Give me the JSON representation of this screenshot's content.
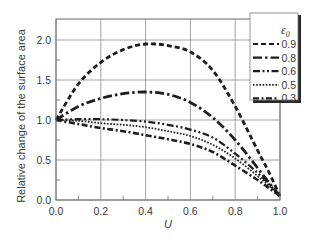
{
  "chart_data": {
    "type": "line",
    "title": "",
    "xlabel": "U",
    "ylabel": "Relative change of the surface area",
    "xlim": [
      0.0,
      1.0
    ],
    "ylim": [
      0.0,
      2.25
    ],
    "x_ticks": [
      "0.0",
      "0.2",
      "0.4",
      "0.6",
      "0.8",
      "1.0"
    ],
    "y_ticks": [
      "0.0",
      "0.5",
      "1.0",
      "1.5",
      "2.0"
    ],
    "grid": true,
    "legend": {
      "title": "ε0",
      "position": "upper right",
      "entries": [
        "0.9",
        "0.8",
        "0.6",
        "0.5",
        "0.3"
      ]
    },
    "x": [
      0.0,
      0.1,
      0.2,
      0.3,
      0.4,
      0.5,
      0.6,
      0.7,
      0.8,
      0.9,
      0.95,
      1.0
    ],
    "series": [
      {
        "name": "0.9",
        "style": "dashed",
        "values": [
          1.0,
          1.45,
          1.72,
          1.88,
          1.95,
          1.93,
          1.85,
          1.62,
          1.17,
          0.62,
          0.35,
          0.05
        ]
      },
      {
        "name": "0.8",
        "style": "long-dash-dot",
        "values": [
          1.0,
          1.17,
          1.27,
          1.33,
          1.35,
          1.32,
          1.22,
          1.03,
          0.75,
          0.4,
          0.22,
          0.05
        ]
      },
      {
        "name": "0.6",
        "style": "dash-dot-dot",
        "values": [
          1.0,
          1.01,
          1.01,
          1.0,
          0.98,
          0.94,
          0.88,
          0.78,
          0.58,
          0.34,
          0.2,
          0.05
        ]
      },
      {
        "name": "0.5",
        "style": "dotted",
        "values": [
          1.0,
          0.99,
          0.96,
          0.94,
          0.91,
          0.86,
          0.8,
          0.69,
          0.52,
          0.3,
          0.18,
          0.05
        ]
      },
      {
        "name": "0.3",
        "style": "dash-dot",
        "values": [
          1.0,
          0.95,
          0.9,
          0.86,
          0.81,
          0.76,
          0.7,
          0.6,
          0.43,
          0.25,
          0.15,
          0.05
        ]
      }
    ]
  }
}
